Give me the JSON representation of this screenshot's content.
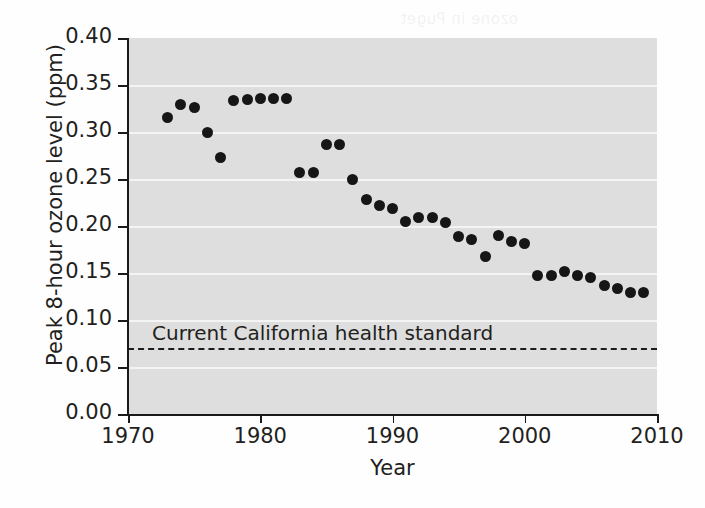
{
  "chart_data": {
    "type": "scatter",
    "title": "",
    "xlabel": "Year",
    "ylabel": "Peak 8-hour ozone level (ppm)",
    "xlim": [
      1970,
      2010
    ],
    "ylim": [
      0.0,
      0.4
    ],
    "grid": true,
    "legend": "none",
    "xticks": [
      "1970",
      "1980",
      "1990",
      "2000",
      "2010"
    ],
    "xtick_values": [
      1970,
      1980,
      1990,
      2000,
      2010
    ],
    "yticks": [
      "0.00",
      "0.05",
      "0.10",
      "0.15",
      "0.20",
      "0.25",
      "0.30",
      "0.35",
      "0.40"
    ],
    "ytick_values": [
      0.0,
      0.05,
      0.1,
      0.15,
      0.2,
      0.25,
      0.3,
      0.35,
      0.4
    ],
    "x": [
      1973,
      1974,
      1975,
      1976,
      1977,
      1978,
      1979,
      1980,
      1981,
      1982,
      1983,
      1984,
      1985,
      1986,
      1987,
      1988,
      1989,
      1990,
      1991,
      1992,
      1993,
      1994,
      1995,
      1996,
      1997,
      1998,
      1999,
      2000,
      2001,
      2002,
      2003,
      2004,
      2005,
      2006,
      2007,
      2008,
      2009
    ],
    "values": [
      0.315,
      0.329,
      0.326,
      0.299,
      0.273,
      0.334,
      0.335,
      0.336,
      0.336,
      0.336,
      0.257,
      0.257,
      0.287,
      0.287,
      0.249,
      0.228,
      0.222,
      0.219,
      0.205,
      0.209,
      0.209,
      0.204,
      0.189,
      0.186,
      0.168,
      0.19,
      0.184,
      0.181,
      0.147,
      0.147,
      0.152,
      0.147,
      0.145,
      0.137,
      0.134,
      0.129,
      0.129
    ],
    "annotation": {
      "text": "Current California health standard",
      "line_type": "dashed",
      "y_value": 0.07
    },
    "colors": {
      "plot_background": "#dedede",
      "gridline": "#f4f4f4",
      "marker": "#161616",
      "axis": "#1a1a1a",
      "text": "#231f20"
    }
  },
  "ghost_text": [
    "ozone in Puget",
    "Record 2013",
    "Air Quality"
  ]
}
